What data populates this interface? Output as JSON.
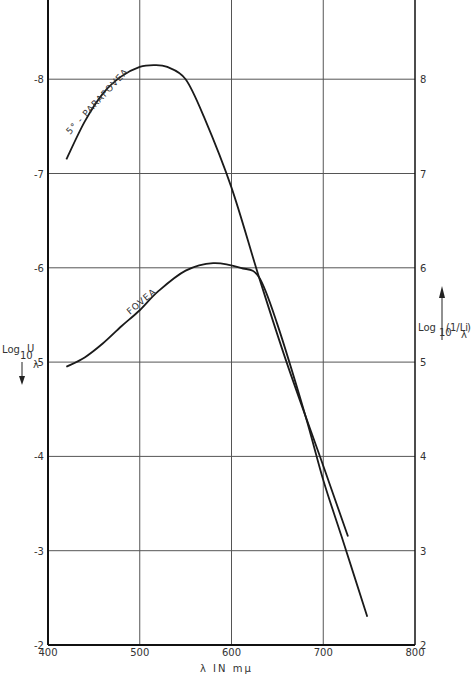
{
  "chart_data": {
    "type": "line",
    "title": "",
    "xlabel": "λ IN mμ",
    "ylabel_left": "Log10 Uλ",
    "ylabel_right": "Log10(1/Liλ)",
    "xlim": [
      400,
      800
    ],
    "ylim_left": [
      -2,
      -8.9
    ],
    "ylim_right": [
      2,
      8.9
    ],
    "x_ticks": [
      "400",
      "500",
      "600",
      "700",
      "800"
    ],
    "y_ticks_left": [
      "-2",
      "-3",
      "-4",
      "-5",
      "-6",
      "-7",
      "-8"
    ],
    "y_ticks_right": [
      "2",
      "3",
      "4",
      "5",
      "6",
      "7",
      "8"
    ],
    "grid": true,
    "series": [
      {
        "name": "5° - PARAFOVEA",
        "x": [
          420,
          440,
          460,
          480,
          500,
          515,
          530,
          550,
          570,
          600,
          630,
          660,
          700,
          727
        ],
        "values": [
          7.15,
          7.55,
          7.85,
          8.03,
          8.13,
          8.15,
          8.13,
          8.0,
          7.6,
          6.85,
          5.9,
          5.0,
          3.9,
          3.15
        ]
      },
      {
        "name": "FOVEA",
        "x": [
          420,
          440,
          460,
          480,
          500,
          520,
          550,
          580,
          610,
          630,
          650,
          680,
          700,
          720,
          748
        ],
        "values": [
          4.95,
          5.05,
          5.2,
          5.38,
          5.55,
          5.75,
          5.97,
          6.05,
          6.0,
          5.9,
          5.4,
          4.45,
          3.75,
          3.15,
          2.3
        ]
      }
    ]
  },
  "labels": {
    "x_axis": "λ IN mμ",
    "left_axis_main": "Log",
    "left_axis_sub": "10",
    "left_axis_var": "U",
    "left_axis_var_sub": "λ",
    "right_axis_main": "Log",
    "right_axis_sub": "10",
    "right_axis_var": "(1/Li",
    "right_axis_var_sub": "λ",
    "right_axis_close": ")",
    "series_parafovea": "5° - PARAFOVEA",
    "series_fovea": "FOVEA"
  }
}
